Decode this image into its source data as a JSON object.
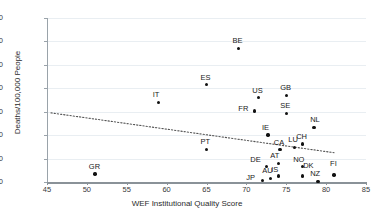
{
  "chart_data": {
    "type": "scatter",
    "title": "",
    "xlabel": "WEF Institutional Quality Score",
    "ylabel": "Deaths/100,000 People",
    "xlim": [
      45,
      85
    ],
    "ylim": [
      0,
      140
    ],
    "xticks": [
      45,
      50,
      55,
      60,
      65,
      70,
      75,
      80,
      85
    ],
    "yticks": [
      0,
      20,
      40,
      60,
      80,
      100,
      120,
      140
    ],
    "grid": "horizontal",
    "legend": "none",
    "point_color": "#111111",
    "trendline": {
      "style": "dotted",
      "color": "#555555",
      "x": [
        45.5,
        81.0
      ],
      "y": [
        59.0,
        25.0
      ]
    },
    "points": [
      {
        "label": "GR",
        "x": 51.0,
        "y": 7.0,
        "label_dx": -1,
        "label_dy": -9
      },
      {
        "label": "IT",
        "x": 59.0,
        "y": 68.0,
        "label_dx": -1,
        "label_dy": -9
      },
      {
        "label": "ES",
        "x": 65.0,
        "y": 83.0,
        "label_dx": -1,
        "label_dy": -9
      },
      {
        "label": "PT",
        "x": 65.0,
        "y": 28.0,
        "label_dx": -1,
        "label_dy": -9
      },
      {
        "label": "BE",
        "x": 69.0,
        "y": 114.0,
        "label_dx": -1,
        "label_dy": -9
      },
      {
        "label": "FR",
        "x": 71.0,
        "y": 60.5,
        "label_dx": -11,
        "label_dy": -4
      },
      {
        "label": "US",
        "x": 71.5,
        "y": 72.0,
        "label_dx": -1,
        "label_dy": -9
      },
      {
        "label": "IE",
        "x": 72.7,
        "y": 40.0,
        "label_dx": -1,
        "label_dy": -9
      },
      {
        "label": "JP",
        "x": 72.0,
        "y": 1.5,
        "label_dx": -11,
        "label_dy": -4
      },
      {
        "label": "DE",
        "x": 72.5,
        "y": 13.0,
        "label_dx": -11,
        "label_dy": -9
      },
      {
        "label": "AU",
        "x": 73.0,
        "y": 3.0,
        "label_dx": -3,
        "label_dy": -9
      },
      {
        "label": "AT",
        "x": 74.0,
        "y": 16.0,
        "label_dx": -3,
        "label_dy": -9
      },
      {
        "label": "IS",
        "x": 74.0,
        "y": 5.0,
        "label_dx": -2,
        "label_dy": -8
      },
      {
        "label": "CA",
        "x": 74.2,
        "y": 28.0,
        "label_dx": -1,
        "label_dy": -8
      },
      {
        "label": "GB",
        "x": 75.0,
        "y": 74.0,
        "label_dx": -1,
        "label_dy": -9
      },
      {
        "label": "SE",
        "x": 75.0,
        "y": 58.5,
        "label_dx": -1,
        "label_dy": -9
      },
      {
        "label": "LU",
        "x": 76.0,
        "y": 29.5,
        "label_dx": -1,
        "label_dy": -9
      },
      {
        "label": "NO",
        "x": 77.0,
        "y": 13.0,
        "label_dx": -4,
        "label_dy": -9
      },
      {
        "label": "CH",
        "x": 77.0,
        "y": 32.5,
        "label_dx": -1,
        "label_dy": -9
      },
      {
        "label": "NZ",
        "x": 79.0,
        "y": 0.5,
        "label_dx": -3,
        "label_dy": -9
      },
      {
        "label": "DK",
        "x": 77.0,
        "y": 5.0,
        "label_dx": 6,
        "label_dy": -12
      },
      {
        "label": "NL",
        "x": 78.5,
        "y": 46.5,
        "label_dx": 1,
        "label_dy": -10
      },
      {
        "label": "FI",
        "x": 81.0,
        "y": 6.0,
        "label_dx": 1,
        "label_dy": -13
      }
    ]
  }
}
